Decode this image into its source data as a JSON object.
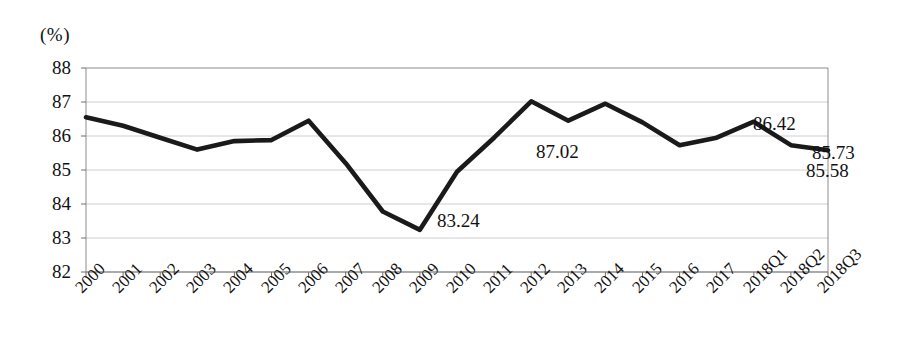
{
  "chart_data": {
    "type": "line",
    "title": "",
    "subtitle": "",
    "xlabel": "",
    "ylabel": "",
    "unit_label": "(%)",
    "ylim": [
      82,
      88
    ],
    "ytick_labels": [
      "88",
      "87",
      "86",
      "85",
      "84",
      "83",
      "82"
    ],
    "yticks": [
      88,
      87,
      86,
      85,
      84,
      83,
      82
    ],
    "grid": true,
    "grid_axis": "y",
    "legend": null,
    "legend_position": "none",
    "line_color": "#1a1a1a",
    "categories": [
      "2000",
      "2001",
      "2002",
      "2003",
      "2004",
      "2005",
      "2006",
      "2007",
      "2008",
      "2009",
      "2010",
      "2011",
      "2012",
      "2013",
      "2014",
      "2015",
      "2016",
      "2017",
      "2018Q1",
      "2018Q2",
      "2018Q3"
    ],
    "values": [
      86.55,
      86.3,
      85.95,
      85.6,
      85.85,
      85.88,
      86.45,
      85.2,
      83.78,
      83.24,
      84.95,
      85.95,
      87.02,
      86.45,
      86.95,
      86.4,
      85.73,
      85.95,
      86.42,
      85.73,
      85.58
    ],
    "annotations": [
      {
        "category": "2009",
        "value": 83.24,
        "text": "83.24"
      },
      {
        "category": "2012",
        "value": 87.02,
        "text": "87.02"
      },
      {
        "category": "2018Q1",
        "value": 86.42,
        "text": "86.42"
      },
      {
        "category": "2018Q2",
        "value": 85.73,
        "text": "85.73"
      },
      {
        "category": "2018Q3",
        "value": 85.58,
        "text": "85.58"
      }
    ]
  },
  "annotation_positions": [
    {
      "name": "annotation-83-24",
      "text": "83.24",
      "left": 437,
      "top": 211
    },
    {
      "name": "annotation-87-02",
      "text": "87.02",
      "left": 536,
      "top": 142
    },
    {
      "name": "annotation-86-42",
      "text": "86.42",
      "left": 753,
      "top": 114
    },
    {
      "name": "annotation-85-73",
      "text": "85.73",
      "left": 812,
      "top": 143
    },
    {
      "name": "annotation-85-58",
      "text": "85.58",
      "left": 806,
      "top": 161
    }
  ],
  "plot_geometry": {
    "left": 86,
    "right": 828,
    "top": 68,
    "bottom": 272
  }
}
